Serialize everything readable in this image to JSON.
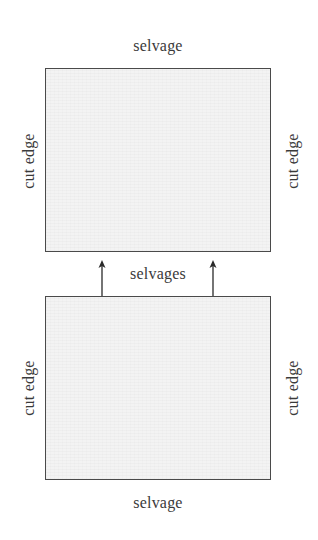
{
  "diagram": {
    "type": "fabric-layout",
    "colors": {
      "border": "#4a4a4a",
      "fill": "#f3f3f3",
      "text": "#3a3a3a",
      "arrow": "#2a2a2a"
    },
    "top_piece": {
      "top_label": "selvage",
      "left_label": "cut edge",
      "right_label": "cut edge"
    },
    "middle": {
      "label": "selvages",
      "arrows": [
        "up",
        "up"
      ]
    },
    "bottom_piece": {
      "bottom_label": "selvage",
      "left_label": "cut edge",
      "right_label": "cut edge"
    }
  }
}
